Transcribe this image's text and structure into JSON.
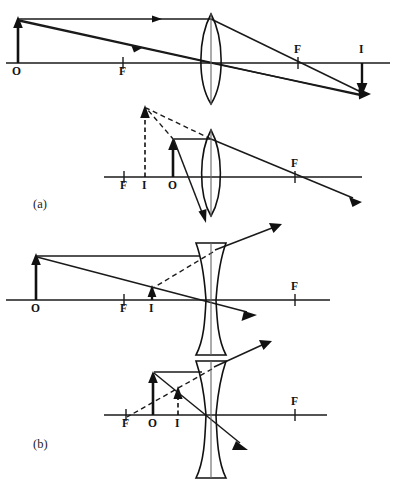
{
  "figure": {
    "width": 396,
    "height": 487,
    "background": "#ffffff",
    "ink_color": "#111111",
    "panels": [
      {
        "id": "panel-a",
        "label": "(a)",
        "label_x": 33,
        "label_y": 198,
        "lens_type": "converging",
        "diagrams": [
          {
            "id": "a-top",
            "caption_labels": [
              "O",
              "F",
              "F",
              "I"
            ],
            "axis_y": 63,
            "axis_x1": 6,
            "axis_x2": 390,
            "lens_center_x": 211,
            "object": {
              "label": "O",
              "x": 18,
              "base_y": 63,
              "tip_y": 19,
              "direction": "up",
              "kind": "real"
            },
            "image": {
              "label": "I",
              "x": 362,
              "base_y": 63,
              "tip_y": 95,
              "direction": "down",
              "kind": "real-inverted"
            },
            "focal_points": [
              {
                "label": "F",
                "x": 123,
                "y": 63,
                "label_dx": -3,
                "label_dy": 14
              },
              {
                "label": "F",
                "x": 298,
                "y": 63,
                "label_dx": -3,
                "label_dy": -6
              }
            ],
            "image_label_pos": {
              "x": 359,
              "y": 48
            }
          },
          {
            "id": "a-bottom",
            "caption_labels": [
              "F",
              "I",
              "O",
              "F"
            ],
            "axis_y": 177,
            "axis_x1": 104,
            "axis_x2": 362,
            "lens_center_x": 211,
            "object": {
              "label": "O",
              "x": 173,
              "base_y": 177,
              "tip_y": 140,
              "direction": "up",
              "kind": "real"
            },
            "image": {
              "label": "I",
              "x": 145,
              "base_y": 177,
              "tip_y": 106,
              "direction": "up",
              "kind": "virtual-upright"
            },
            "focal_points": [
              {
                "label": "F",
                "x": 124,
                "y": 177,
                "label_dx": -3,
                "label_dy": 14
              },
              {
                "label": "F",
                "x": 295,
                "y": 177,
                "label_dx": -3,
                "label_dy": -6
              }
            ]
          }
        ]
      },
      {
        "id": "panel-b",
        "label": "(b)",
        "label_x": 33,
        "label_y": 438,
        "lens_type": "diverging",
        "diagrams": [
          {
            "id": "b-top",
            "caption_labels": [
              "O",
              "F",
              "I",
              "F"
            ],
            "axis_y": 300,
            "axis_x1": 6,
            "axis_x2": 330,
            "lens_center_x": 211,
            "object": {
              "label": "O",
              "x": 36,
              "base_y": 300,
              "tip_y": 256,
              "direction": "up",
              "kind": "real"
            },
            "image": {
              "label": "I",
              "x": 152,
              "base_y": 300,
              "tip_y": 287,
              "direction": "up",
              "kind": "virtual-upright"
            },
            "focal_points": [
              {
                "label": "F",
                "x": 124,
                "y": 300,
                "label_dx": -3,
                "label_dy": 14
              },
              {
                "label": "F",
                "x": 295,
                "y": 300,
                "label_dx": -3,
                "label_dy": -6
              }
            ]
          },
          {
            "id": "b-bottom",
            "caption_labels": [
              "F",
              "O",
              "I",
              "F"
            ],
            "axis_y": 415,
            "axis_x1": 104,
            "axis_x2": 327,
            "lens_center_x": 211,
            "object": {
              "label": "O",
              "x": 153,
              "base_y": 415,
              "tip_y": 372,
              "direction": "up",
              "kind": "real"
            },
            "image": {
              "label": "I",
              "x": 178,
              "base_y": 415,
              "tip_y": 387,
              "direction": "up",
              "kind": "virtual-upright"
            },
            "focal_points": [
              {
                "label": "F",
                "x": 126,
                "y": 415,
                "label_dx": -3,
                "label_dy": 14
              },
              {
                "label": "F",
                "x": 295,
                "y": 415,
                "label_dx": -3,
                "label_dy": -6
              }
            ]
          }
        ]
      }
    ],
    "legend_symbols": {
      "O": "object",
      "I": "image",
      "F": "focal point"
    },
    "labels": {
      "object": "O",
      "image": "I",
      "focus": "F",
      "panel_a": "(a)",
      "panel_b": "(b)"
    }
  }
}
